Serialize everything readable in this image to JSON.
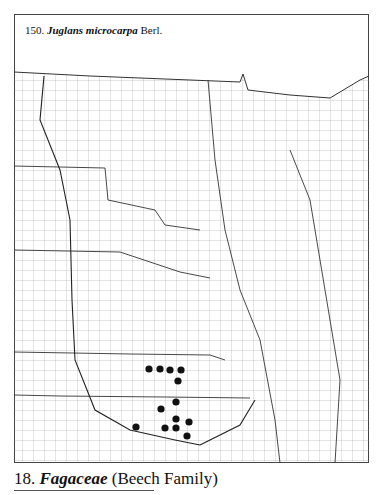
{
  "caption": {
    "number": "150.",
    "species": "Juglans microcarpa",
    "author": "Berl."
  },
  "section": {
    "number": "18.",
    "family": "Fagaceae",
    "common": "(Beech Family)"
  },
  "map": {
    "dots": [
      [
        149,
        369
      ],
      [
        160,
        369
      ],
      [
        170,
        370
      ],
      [
        181,
        370
      ],
      [
        178,
        381
      ],
      [
        176,
        402
      ],
      [
        161,
        409
      ],
      [
        176,
        419
      ],
      [
        189,
        422
      ],
      [
        165,
        428
      ],
      [
        176,
        428
      ],
      [
        187,
        436
      ],
      [
        136,
        427
      ]
    ]
  }
}
